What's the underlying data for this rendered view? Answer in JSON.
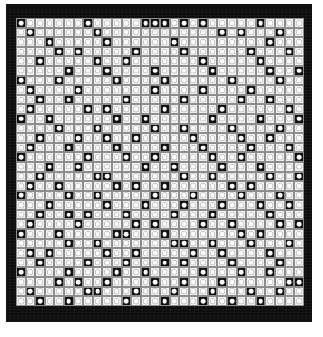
{
  "figure": {
    "type": "cell-matrix",
    "rows": 30,
    "columns": 30,
    "cell_size_px": 9.6,
    "frame_color": "#0d0d0d",
    "light_cell_color": "#f2f2f2",
    "dark_cell_color": "#101010",
    "dot_color": "#fbfbfb",
    "gridline_color": "#8d8d8d",
    "caption": "",
    "legend": {
      "light_cell_meaning": "white cell with white dot",
      "dark_cell_meaning": "black cell with white dot"
    },
    "matrix": [
      "100000010000011101010000010000",
      "010000001000000000000101000100",
      "000100000100000010000000001000",
      "000010100000100001000000100010",
      "001000001001000000010000010000",
      "000001000100001000001000001001",
      "100010000010000100000010000100",
      "010000100000001000010000100000",
      "001001000001000001000001001000",
      "010000010100000100000100000010",
      "100100000010010000001000010001",
      "000010001000001001000010000100",
      "001000100100100000100001001000",
      "010001000010000100010000100010",
      "100000010001001000001001000001",
      "000100100000010010000100010000",
      "001000001100000001001000001001",
      "010010000010100100000010100000",
      "100001001000001000100001000100",
      "000100000100010001000100010010",
      "001001010001000010001000001000",
      "010000100000101000010010000101",
      "100010000011000100000001010000",
      "000001001000000011001000100010",
      "010100000100100000100100001000",
      "001000010001000101000010000100",
      "100001000010010000010001001000",
      "000010100100001001000100000011",
      "010000011000100010001000100100",
      "001001000001000100010010010000"
    ]
  }
}
